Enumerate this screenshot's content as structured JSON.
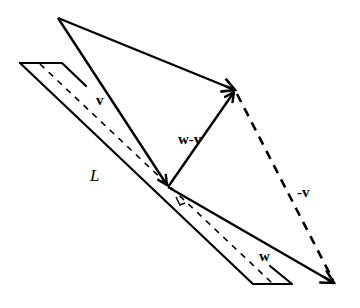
{
  "diagram": {
    "type": "vector-projection",
    "colors": {
      "stroke": "#000000",
      "background": "#ffffff"
    },
    "labels": {
      "v": "v",
      "w_minus_v": "w-v",
      "neg_v": "-v",
      "w": "w",
      "line": "L"
    },
    "points": {
      "top_vertex": [
        58,
        18
      ],
      "v_tip": [
        168,
        186
      ],
      "w_from_top_tip": [
        237,
        90
      ],
      "w_tip": [
        336,
        284
      ]
    },
    "plane": {
      "outline": [
        [
          20,
          63
        ],
        [
          62,
          63
        ],
        [
          86,
          86
        ]
      ],
      "outer_edge": [
        [
          20,
          63
        ],
        [
          253,
          284
        ]
      ],
      "bottom": [
        [
          253,
          284
        ],
        [
          292,
          284
        ],
        [
          270,
          266
        ]
      ],
      "dashed_line": [
        [
          40,
          64
        ],
        [
          272,
          283
        ]
      ]
    }
  }
}
